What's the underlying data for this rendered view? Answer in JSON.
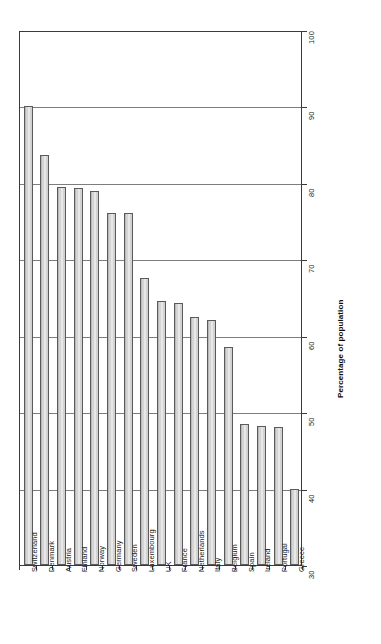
{
  "chart_data": {
    "type": "bar",
    "title": "",
    "subtitle": "",
    "xlabel": "",
    "ylabel": "Percentage of population",
    "ylim": [
      30,
      100
    ],
    "yticks": [
      30,
      40,
      50,
      60,
      70,
      80,
      90,
      100
    ],
    "ytick_labels": [
      "30",
      "40",
      "50",
      "60",
      "70",
      "80",
      "90",
      "100"
    ],
    "grid": true,
    "legend": null,
    "orientation": "vertical",
    "categories": [
      "Switzerland",
      "Denmark",
      "Austria",
      "Finland",
      "Norway",
      "Germany",
      "Sweden",
      "Luxembourg",
      "UK",
      "France",
      "Netherlands",
      "Italy",
      "Belgium",
      "Spain",
      "Ireland",
      "Portugal",
      "Greece"
    ],
    "values": [
      90,
      83.7,
      79.5,
      79.3,
      79,
      76,
      76,
      67.5,
      64.5,
      64.3,
      62.5,
      62,
      58.5,
      48.5,
      48.2,
      48,
      40
    ],
    "bar_color": "#d2d2d2",
    "bar_edge_color": "#5a5a5a",
    "grid_color": "#7d7d7d",
    "axis_color": "#3a3a3a",
    "background_color": "#ffffff"
  },
  "axes": {
    "y_title": "Percentage of population"
  }
}
